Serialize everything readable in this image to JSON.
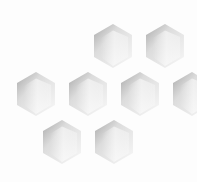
{
  "scene": {
    "description": "Embossed white hexagons on white background",
    "background": "#fdfdfd",
    "hex_shadow": "#9a9a9a",
    "hex_mid": "#d6d6d6",
    "hex_light": "#f6f6f6",
    "hex_width": 38,
    "hex_height": 44,
    "hexagons": [
      {
        "cx": 113,
        "top": 24
      },
      {
        "cx": 165,
        "top": 24
      },
      {
        "cx": 36,
        "top": 72
      },
      {
        "cx": 88,
        "top": 72
      },
      {
        "cx": 140,
        "top": 72
      },
      {
        "cx": 192,
        "top": 72
      },
      {
        "cx": 62,
        "top": 120
      },
      {
        "cx": 114,
        "top": 120
      }
    ]
  }
}
